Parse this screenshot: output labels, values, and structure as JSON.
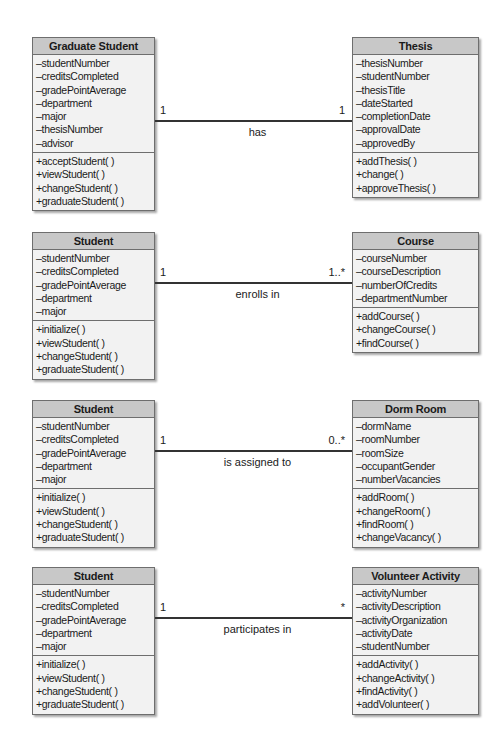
{
  "diagrams": [
    {
      "left": {
        "name": "Graduate Student",
        "attributes": [
          "–studentNumber",
          "–creditsCompleted",
          "–gradePointAverage",
          "–department",
          "–major",
          "–thesisNumber",
          "–advisor"
        ],
        "methods": [
          "+acceptStudent( )",
          "+viewStudent( )",
          "+changeStudent( )",
          "+graduateStudent( )"
        ]
      },
      "right": {
        "name": "Thesis",
        "attributes": [
          "–thesisNumber",
          "–studentNumber",
          "–thesisTitle",
          "–dateStarted",
          "–completionDate",
          "–approvalDate",
          "–approvedBy"
        ],
        "methods": [
          "+addThesis( )",
          "+change( )",
          "+approveThesis( )"
        ]
      },
      "association": {
        "label": "has",
        "left_multiplicity": "1",
        "right_multiplicity": "1"
      }
    },
    {
      "left": {
        "name": "Student",
        "attributes": [
          "–studentNumber",
          "–creditsCompleted",
          "–gradePointAverage",
          "–department",
          "–major"
        ],
        "methods": [
          "+initialize( )",
          "+viewStudent( )",
          "+changeStudent( )",
          "+graduateStudent( )"
        ]
      },
      "right": {
        "name": "Course",
        "attributes": [
          "–courseNumber",
          "–courseDescription",
          "–numberOfCredits",
          "–departmentNumber"
        ],
        "methods": [
          "+addCourse( )",
          "+changeCourse( )",
          "+findCourse( )"
        ]
      },
      "association": {
        "label": "enrolls in",
        "left_multiplicity": "1",
        "right_multiplicity": "1..*"
      }
    },
    {
      "left": {
        "name": "Student",
        "attributes": [
          "–studentNumber",
          "–creditsCompleted",
          "–gradePointAverage",
          "–department",
          "–major"
        ],
        "methods": [
          "+initialize( )",
          "+viewStudent( )",
          "+changeStudent( )",
          "+graduateStudent( )"
        ]
      },
      "right": {
        "name": "Dorm Room",
        "attributes": [
          "–dormName",
          "–roomNumber",
          "–roomSize",
          "–occupantGender",
          "–numberVacancies"
        ],
        "methods": [
          "+addRoom( )",
          "+changeRoom( )",
          "+findRoom( )",
          "+changeVacancy( )"
        ]
      },
      "association": {
        "label": "is assigned to",
        "left_multiplicity": "1",
        "right_multiplicity": "0..*"
      }
    },
    {
      "left": {
        "name": "Student",
        "attributes": [
          "–studentNumber",
          "–creditsCompleted",
          "–gradePointAverage",
          "–department",
          "–major"
        ],
        "methods": [
          "+initialize( )",
          "+viewStudent( )",
          "+changeStudent( )",
          "+graduateStudent( )"
        ]
      },
      "right": {
        "name": "Volunteer Activity",
        "attributes": [
          "–activityNumber",
          "–activityDescription",
          "–activityOrganization",
          "–activityDate",
          "–studentNumber"
        ],
        "methods": [
          "+addActivity( )",
          "+changeActivity( )",
          "+findActivity( )",
          "+addVolunteer( )"
        ]
      },
      "association": {
        "label": "participates in",
        "left_multiplicity": "1",
        "right_multiplicity": "*"
      }
    }
  ]
}
